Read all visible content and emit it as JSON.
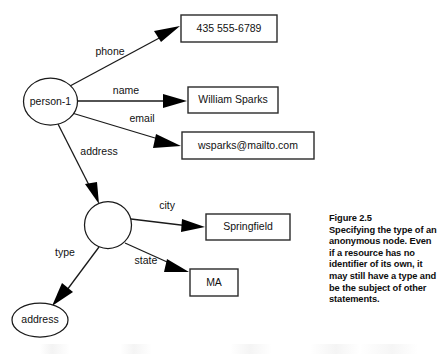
{
  "figure": {
    "caption_title": "Figure 2.5",
    "caption_body": "Specifying the type of an anonymous node. Even if a resource has no identifier of its own, it may still have a type and be the subject of other statements."
  },
  "diagram": {
    "type": "rdf-graph",
    "nodes": [
      {
        "id": "person-1",
        "shape": "ellipse",
        "label": "person-1",
        "cx": 50.5,
        "cy": 101.5,
        "rx": 27,
        "ry": 23.5
      },
      {
        "id": "anon-node",
        "shape": "circle",
        "label": "",
        "cx": 108,
        "cy": 225,
        "rx": 23.5,
        "ry": 23.5
      },
      {
        "id": "address-type",
        "shape": "ellipse",
        "label": "address",
        "cx": 40,
        "cy": 320,
        "rx": 28,
        "ry": 17
      }
    ],
    "literals": [
      {
        "id": "phone-value",
        "shape": "rect",
        "label": "435 555-6789",
        "x": 181,
        "y": 15,
        "w": 96,
        "h": 27
      },
      {
        "id": "name-value",
        "shape": "rect",
        "label": "William Sparks",
        "x": 188,
        "y": 87,
        "w": 90,
        "h": 26
      },
      {
        "id": "email-value",
        "shape": "rect",
        "label": "wsparks@mailto.com",
        "x": 182,
        "y": 132,
        "w": 132,
        "h": 27
      },
      {
        "id": "city-value",
        "shape": "rect",
        "label": "Springfield",
        "x": 206,
        "y": 214,
        "w": 84,
        "h": 26
      },
      {
        "id": "state-value",
        "shape": "rect",
        "label": "MA",
        "x": 190,
        "y": 269,
        "w": 48,
        "h": 27
      }
    ],
    "edges": [
      {
        "id": "edge-phone",
        "label": "phone",
        "from": "person-1",
        "to": "phone-value",
        "x1": 70,
        "y1": 86,
        "x2": 179,
        "y2": 27,
        "label_x": 110,
        "label_y": 52
      },
      {
        "id": "edge-name",
        "label": "name",
        "from": "person-1",
        "to": "name-value",
        "x1": 77,
        "y1": 101,
        "x2": 186,
        "y2": 101,
        "label_x": 126,
        "label_y": 91
      },
      {
        "id": "edge-email",
        "label": "email",
        "from": "person-1",
        "to": "email-value",
        "x1": 72,
        "y1": 113,
        "x2": 180,
        "y2": 146,
        "label_x": 142,
        "label_y": 119
      },
      {
        "id": "edge-address",
        "label": "address",
        "from": "person-1",
        "to": "anon-node",
        "x1": 58,
        "y1": 124,
        "x2": 98,
        "y2": 203,
        "label_x": 99,
        "label_y": 152
      },
      {
        "id": "edge-city",
        "label": "city",
        "from": "anon-node",
        "to": "city-value",
        "x1": 131,
        "y1": 219,
        "x2": 204,
        "y2": 227,
        "label_x": 167,
        "label_y": 206
      },
      {
        "id": "edge-state",
        "label": "state",
        "from": "anon-node",
        "to": "state-value",
        "x1": 125,
        "y1": 243,
        "x2": 188,
        "y2": 272,
        "label_x": 146,
        "label_y": 261
      },
      {
        "id": "edge-type",
        "label": "type",
        "from": "anon-node",
        "to": "address-type",
        "x1": 99,
        "y1": 247,
        "x2": 53,
        "y2": 305,
        "label_x": 65,
        "label_y": 253
      }
    ]
  },
  "colors": {
    "background": "#ffffff",
    "stroke": "#1a1a1a",
    "text": "#111111",
    "arrow_fill": "#000000"
  }
}
